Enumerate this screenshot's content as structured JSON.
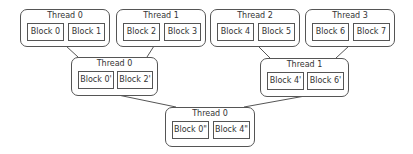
{
  "diagram": {
    "type": "reduction-tree",
    "levels": [
      {
        "level": 0,
        "threads": [
          {
            "title": "Thread 0",
            "blocks": [
              "Block 0",
              "Block 1"
            ]
          },
          {
            "title": "Thread 1",
            "blocks": [
              "Block 2",
              "Block 3"
            ]
          },
          {
            "title": "Thread 2",
            "blocks": [
              "Block 4",
              "Block 5"
            ]
          },
          {
            "title": "Thread 3",
            "blocks": [
              "Block 6",
              "Block 7"
            ]
          }
        ]
      },
      {
        "level": 1,
        "threads": [
          {
            "title": "Thread 0",
            "blocks": [
              "Block 0'",
              "Block 2'"
            ]
          },
          {
            "title": "Thread 1",
            "blocks": [
              "Block 4'",
              "Block 6'"
            ]
          }
        ]
      },
      {
        "level": 2,
        "threads": [
          {
            "title": "Thread 0",
            "blocks": [
              "Block 0\"",
              "Block 4\""
            ]
          }
        ]
      }
    ],
    "colors": {
      "border": "#555555",
      "text": "#333333",
      "background": "#ffffff"
    }
  }
}
